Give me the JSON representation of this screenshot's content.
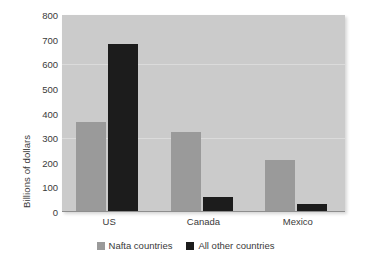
{
  "chart_data": {
    "type": "bar",
    "title": "",
    "xlabel": "",
    "ylabel": "Billions of dollars",
    "categories": [
      "US",
      "Canada",
      "Mexico"
    ],
    "series": [
      {
        "name": "Nafta countries",
        "color": "#9a9a9a",
        "values": [
          365,
          325,
          211
        ]
      },
      {
        "name": "All other countries",
        "color": "#1c1c1c",
        "values": [
          682,
          61,
          32
        ]
      }
    ],
    "ylim": [
      0,
      800
    ],
    "ytick_step": 100,
    "yticks": [
      "0",
      "100",
      "200",
      "300",
      "400",
      "500",
      "600",
      "700",
      "800"
    ],
    "grid": "faint-horizontal",
    "legend_position": "bottom-center",
    "plot_background": "#cbcbcb",
    "page_background": "#ffffff"
  },
  "legend": {
    "items": [
      {
        "label": "Nafta countries",
        "color": "#9a9a9a"
      },
      {
        "label": "All other countries",
        "color": "#1c1c1c"
      }
    ]
  }
}
